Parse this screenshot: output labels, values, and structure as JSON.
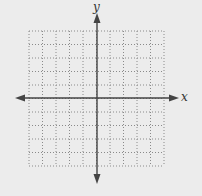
{
  "diagram": {
    "type": "coordinate-grid",
    "x_axis_label": "x",
    "y_axis_label": "y",
    "grid": {
      "columns": 10,
      "rows": 10,
      "left": 29,
      "top": 31,
      "right": 164,
      "bottom": 166,
      "line_style": "dotted"
    },
    "origin": {
      "x": 97,
      "y": 98
    },
    "axes": {
      "x_start": 15,
      "x_end": 179,
      "y_start": 13,
      "y_end": 184,
      "arrows": "both-ends"
    },
    "colors": {
      "background": "#ececec",
      "grid_line": "#8a8a8a",
      "axis": "#444444"
    }
  }
}
